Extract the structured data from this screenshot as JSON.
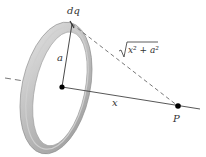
{
  "diagram": {
    "labels": {
      "charge_element": "dq",
      "radius": "a",
      "distance_expr": "x² + a²",
      "axis_distance": "x",
      "point": "P"
    },
    "colors": {
      "ring_light": "#d9d9d9",
      "ring_mid": "#b5b5b5",
      "ring_dark": "#8f8f8f",
      "line": "#444444",
      "dot": "#000000"
    }
  }
}
